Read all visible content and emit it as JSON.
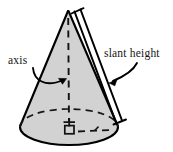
{
  "figure": {
    "shape": "right circular cone",
    "background_color": "#ffffff",
    "cone_fill_color": "#d2d2d2",
    "outline_color": "#000000",
    "dashed_color": "#1a1a1a"
  },
  "labels": {
    "axis": "axis",
    "slant_height": "slant height"
  },
  "annotations": {
    "right_angle_marker": "right-angle square at cone base center",
    "apex_cross": "tick cross at base center where axis meets base",
    "measure_bar": "slant height measurement bar with end ticks"
  },
  "geometry": {
    "apex": [
      68,
      11
    ],
    "base_center": [
      69,
      127
    ],
    "base_rx": 49,
    "base_ry": 18,
    "base_left": [
      20,
      127
    ],
    "base_right": [
      118,
      127
    ],
    "axis_top": [
      68,
      18
    ],
    "axis_bottom": [
      69,
      127
    ],
    "measure_bar_top": [
      80,
      10
    ],
    "measure_bar_bottom": [
      120,
      122
    ],
    "radius_dashed_end": [
      112,
      122
    ]
  }
}
